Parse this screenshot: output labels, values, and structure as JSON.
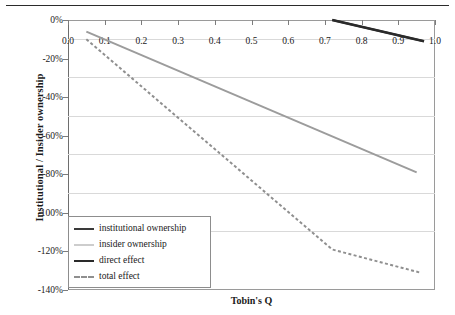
{
  "chart_data": {
    "type": "line",
    "title": "",
    "subtitle": "",
    "xlabel": "Tobin's Q",
    "ylabel": "Institutional / Insider ownership",
    "xlim": [
      0.0,
      1.0
    ],
    "ylim": [
      -140,
      0
    ],
    "grid": true,
    "legend_position": "bottom-left",
    "x_ticks": [
      "0.0",
      "0.1",
      "0.2",
      "0.3",
      "0.4",
      "0.5",
      "0.6",
      "0.7",
      "0.8",
      "0.9",
      "1.0"
    ],
    "x_tick_values": [
      0.0,
      0.1,
      0.2,
      0.3,
      0.4,
      0.5,
      0.6,
      0.7,
      0.8,
      0.9,
      1.0
    ],
    "y_ticks": [
      "0%",
      "-20%",
      "-40%",
      "-60%",
      "-80%",
      "-100%",
      "-120%",
      "-140%"
    ],
    "y_tick_values": [
      0,
      -20,
      -40,
      -60,
      -80,
      -100,
      -120,
      -140
    ],
    "series": [
      {
        "name": "institutional ownership",
        "style": "solid",
        "color": "#3a3a3a",
        "width": 2.2,
        "points": [
          [
            0.72,
            0.0
          ],
          [
            0.97,
            -11.0
          ]
        ]
      },
      {
        "name": "insider ownership",
        "style": "solid",
        "color": "#9c9c9c",
        "width": 2.0,
        "points": [
          [
            0.05,
            -6.0
          ],
          [
            0.95,
            -79.0
          ]
        ]
      },
      {
        "name": "direct effect",
        "style": "solid",
        "color": "#2a2a2a",
        "width": 2.6,
        "points": [
          [
            0.72,
            0.0
          ],
          [
            0.97,
            -11.0
          ]
        ]
      },
      {
        "name": "total effect",
        "style": "dashed",
        "color": "#8f8f8f",
        "width": 2.0,
        "points": [
          [
            0.05,
            -10.0
          ],
          [
            0.72,
            -119.0
          ],
          [
            0.96,
            -131.0
          ]
        ]
      }
    ]
  },
  "legend": {
    "items": [
      {
        "label": "institutional ownership",
        "swatch": "solid-dark"
      },
      {
        "label": "insider ownership",
        "swatch": "solid-gray"
      },
      {
        "label": "direct effect",
        "swatch": "solid-dark-thick"
      },
      {
        "label": "total effect",
        "swatch": "dashed-gray"
      }
    ]
  }
}
